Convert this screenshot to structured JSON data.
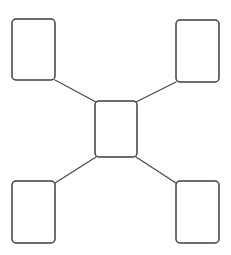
{
  "diagram": {
    "type": "hub-and-spoke",
    "title": "",
    "background_color": "#ffffff",
    "node_fill_color": "#ffffff",
    "node_stroke_color": "#3f3f3f",
    "connector_color": "#4a4a4a",
    "node_stroke_width": 1.5,
    "connector_stroke_width": 1.3,
    "node_corner_radius": 4,
    "node_count": 5,
    "connector_count": 4,
    "nodes": [
      {
        "id": "center",
        "role": "hub",
        "label": "",
        "x": 95,
        "y": 101,
        "width": 42,
        "height": 56
      },
      {
        "id": "top-left",
        "role": "spoke",
        "label": "",
        "x": 12,
        "y": 19,
        "width": 43,
        "height": 61
      },
      {
        "id": "top-right",
        "role": "spoke",
        "label": "",
        "x": 176,
        "y": 20,
        "width": 43,
        "height": 62
      },
      {
        "id": "bottom-left",
        "role": "spoke",
        "label": "",
        "x": 12,
        "y": 181,
        "width": 43,
        "height": 62
      },
      {
        "id": "bottom-right",
        "role": "spoke",
        "label": "",
        "x": 176,
        "y": 181,
        "width": 43,
        "height": 62
      }
    ],
    "connectors": [
      {
        "id": "center-to-top-left",
        "from": "top-left",
        "to": "center",
        "x1": 55,
        "y1": 80,
        "x2": 96,
        "y2": 102,
        "label": ""
      },
      {
        "id": "center-to-top-right",
        "from": "top-right",
        "to": "center",
        "x1": 176,
        "y1": 82,
        "x2": 136,
        "y2": 102,
        "label": ""
      },
      {
        "id": "center-to-bottom-left",
        "from": "bottom-left",
        "to": "center",
        "x1": 55,
        "y1": 183,
        "x2": 96,
        "y2": 157,
        "label": ""
      },
      {
        "id": "center-to-bottom-right",
        "from": "bottom-right",
        "to": "center",
        "x1": 176,
        "y1": 183,
        "x2": 136,
        "y2": 157,
        "label": ""
      }
    ]
  }
}
